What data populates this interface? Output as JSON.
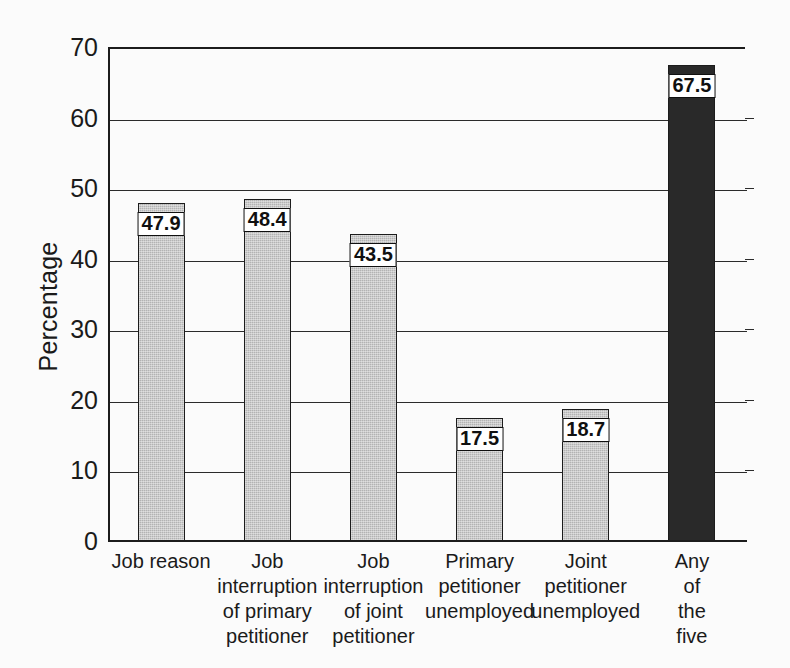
{
  "chart_data": {
    "type": "bar",
    "title": "",
    "xlabel": "",
    "ylabel": "Percentage",
    "ylim": [
      0,
      70
    ],
    "yticks": [
      0,
      10,
      20,
      30,
      40,
      50,
      60,
      70
    ],
    "ytick_labels": [
      "0",
      "10",
      "20",
      "30",
      "40",
      "50",
      "60",
      "70"
    ],
    "grid": "horizontal",
    "legend": "none",
    "categories": [
      "Job reason",
      "Job\ninterruption\nof primary\npetitioner",
      "Job\ninterruption\nof joint\npetitioner",
      "Primary\npetitioner\nunemployed",
      "Joint\npetitioner\nunemployed",
      "Any of\nthe five"
    ],
    "values": [
      47.9,
      48.4,
      43.5,
      17.5,
      18.7,
      67.5
    ],
    "value_labels": [
      "47.9",
      "48.4",
      "43.5",
      "17.5",
      "18.7",
      "67.5"
    ],
    "bar_styles": [
      "light",
      "light",
      "light",
      "light",
      "light",
      "dark"
    ],
    "colors": {
      "bar_light": "#b3b3b3",
      "bar_dark": "#292929",
      "bar_edge": "#1c1c1c",
      "axis": "#1c1c1c",
      "grid": "#2b2b2b",
      "text": "#1a1a1a",
      "background": "#fbfbfb",
      "label_box_fill": "#ffffff",
      "label_box_edge": "#101010"
    }
  }
}
